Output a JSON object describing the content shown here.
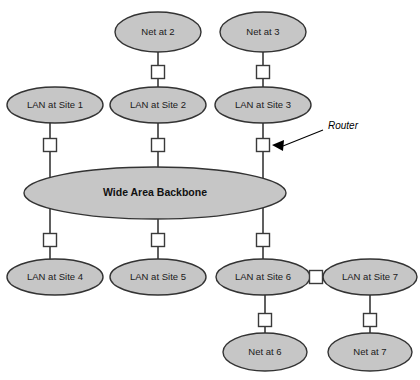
{
  "diagram": {
    "background_color": "#ffffff",
    "node_fill_color": "#c6c6c6",
    "node_stroke_color": "#333333",
    "router_fill_color": "#ffffff",
    "router_stroke_color": "#3a3a3a",
    "line_color": "#2b2b2b",
    "backbone": {
      "label": "Wide Area Backbone",
      "cx": 155,
      "cy": 193,
      "rx": 131,
      "ry": 26
    },
    "nodes": [
      {
        "id": "net-at-2",
        "label": "Net at 2",
        "cx": 158,
        "cy": 32,
        "rx": 43,
        "ry": 20
      },
      {
        "id": "net-at-3",
        "label": "Net at 3",
        "cx": 263,
        "cy": 32,
        "rx": 43,
        "ry": 20
      },
      {
        "id": "lan-at-site-1",
        "label": "LAN at Site 1",
        "cx": 55,
        "cy": 105,
        "rx": 48,
        "ry": 18
      },
      {
        "id": "lan-at-site-2",
        "label": "LAN at Site 2",
        "cx": 158,
        "cy": 105,
        "rx": 48,
        "ry": 18
      },
      {
        "id": "lan-at-site-3",
        "label": "LAN at Site 3",
        "cx": 263,
        "cy": 105,
        "rx": 48,
        "ry": 18
      },
      {
        "id": "lan-at-site-4",
        "label": "LAN at Site 4",
        "cx": 55,
        "cy": 277,
        "rx": 48,
        "ry": 18
      },
      {
        "id": "lan-at-site-5",
        "label": "LAN at Site 5",
        "cx": 158,
        "cy": 277,
        "rx": 48,
        "ry": 18
      },
      {
        "id": "lan-at-site-6",
        "label": "LAN at Site 6",
        "cx": 263,
        "cy": 277,
        "rx": 47,
        "ry": 18
      },
      {
        "id": "lan-at-site-7",
        "label": "LAN at Site 7",
        "cx": 370,
        "cy": 277,
        "rx": 47,
        "ry": 18
      },
      {
        "id": "net-at-6",
        "label": "Net at 6",
        "cx": 265,
        "cy": 352,
        "rx": 42,
        "ry": 19
      },
      {
        "id": "net-at-7",
        "label": "Net at 7",
        "cx": 370,
        "cy": 352,
        "rx": 42,
        "ry": 19
      }
    ],
    "routers": [
      {
        "id": "router-net2-lan2",
        "cx": 158,
        "cy": 72,
        "size": 13
      },
      {
        "id": "router-net3-lan3",
        "cx": 263,
        "cy": 72,
        "size": 13
      },
      {
        "id": "router-lan1-backbone",
        "cx": 50,
        "cy": 145,
        "size": 13
      },
      {
        "id": "router-lan2-backbone",
        "cx": 158,
        "cy": 145,
        "size": 13
      },
      {
        "id": "router-lan3-backbone",
        "cx": 263,
        "cy": 145,
        "size": 13
      },
      {
        "id": "router-backbone-lan4",
        "cx": 50,
        "cy": 240,
        "size": 13
      },
      {
        "id": "router-backbone-lan5",
        "cx": 158,
        "cy": 240,
        "size": 13
      },
      {
        "id": "router-backbone-lan6",
        "cx": 263,
        "cy": 240,
        "size": 13
      },
      {
        "id": "router-lan6-lan7",
        "cx": 316,
        "cy": 277,
        "size": 13
      },
      {
        "id": "router-lan6-net6",
        "cx": 265,
        "cy": 320,
        "size": 13
      },
      {
        "id": "router-lan7-net7",
        "cx": 370,
        "cy": 320,
        "size": 13
      }
    ],
    "links": [
      {
        "id": "link-net2-router",
        "x1": 158,
        "y1": 52,
        "x2": 158,
        "y2": 66
      },
      {
        "id": "link-router-lan2",
        "x1": 158,
        "y1": 79,
        "x2": 158,
        "y2": 88
      },
      {
        "id": "link-net3-router",
        "x1": 263,
        "y1": 52,
        "x2": 263,
        "y2": 66
      },
      {
        "id": "link-router-lan3",
        "x1": 263,
        "y1": 79,
        "x2": 263,
        "y2": 88
      },
      {
        "id": "link-lan1-router",
        "x1": 50,
        "y1": 122,
        "x2": 50,
        "y2": 139
      },
      {
        "id": "link-router-backbone1",
        "x1": 50,
        "y1": 152,
        "x2": 50,
        "y2": 178
      },
      {
        "id": "link-lan2-router",
        "x1": 158,
        "y1": 123,
        "x2": 158,
        "y2": 139
      },
      {
        "id": "link-router-backbone2",
        "x1": 158,
        "y1": 152,
        "x2": 158,
        "y2": 168
      },
      {
        "id": "link-lan3-router",
        "x1": 263,
        "y1": 123,
        "x2": 263,
        "y2": 139
      },
      {
        "id": "link-router-backbone3",
        "x1": 263,
        "y1": 152,
        "x2": 263,
        "y2": 178
      },
      {
        "id": "link-backbone-router4",
        "x1": 50,
        "y1": 208,
        "x2": 50,
        "y2": 234
      },
      {
        "id": "link-router4-lan4",
        "x1": 50,
        "y1": 247,
        "x2": 50,
        "y2": 260
      },
      {
        "id": "link-backbone-router5",
        "x1": 158,
        "y1": 219,
        "x2": 158,
        "y2": 234
      },
      {
        "id": "link-router5-lan5",
        "x1": 158,
        "y1": 247,
        "x2": 158,
        "y2": 260
      },
      {
        "id": "link-backbone-router6",
        "x1": 263,
        "y1": 208,
        "x2": 263,
        "y2": 234
      },
      {
        "id": "link-router6-lan6",
        "x1": 263,
        "y1": 247,
        "x2": 263,
        "y2": 260
      },
      {
        "id": "link-lan6-routerh",
        "x1": 308,
        "y1": 277,
        "x2": 310,
        "y2": 277
      },
      {
        "id": "link-routerh-lan7",
        "x1": 323,
        "y1": 277,
        "x2": 326,
        "y2": 277
      },
      {
        "id": "link-lan6-router-net6",
        "x1": 265,
        "y1": 295,
        "x2": 265,
        "y2": 314
      },
      {
        "id": "link-router-net6",
        "x1": 265,
        "y1": 327,
        "x2": 265,
        "y2": 334
      },
      {
        "id": "link-lan7-router-net7",
        "x1": 370,
        "y1": 295,
        "x2": 370,
        "y2": 314
      },
      {
        "id": "link-router-net7",
        "x1": 370,
        "y1": 327,
        "x2": 370,
        "y2": 334
      }
    ],
    "annotations": [
      {
        "id": "router-annotation",
        "label": "Router",
        "text_x": 328,
        "text_y": 126,
        "leader_x1": 323,
        "leader_y1": 130,
        "leader_x2": 283,
        "leader_y2": 146,
        "arrow_points": "272,145 284,140 283,151"
      }
    ]
  }
}
